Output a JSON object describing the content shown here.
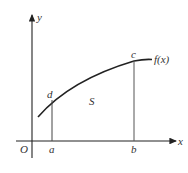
{
  "diagram": {
    "type": "area-under-curve",
    "axes": {
      "x_label": "x",
      "y_label": "y",
      "origin_label": "O"
    },
    "curve_label": "f(x)",
    "region_label": "S",
    "points": {
      "a": "a",
      "b": "b",
      "c": "c",
      "d": "d"
    },
    "colors": {
      "stroke": "#222222",
      "text": "#333333",
      "guide": "#555555"
    }
  }
}
